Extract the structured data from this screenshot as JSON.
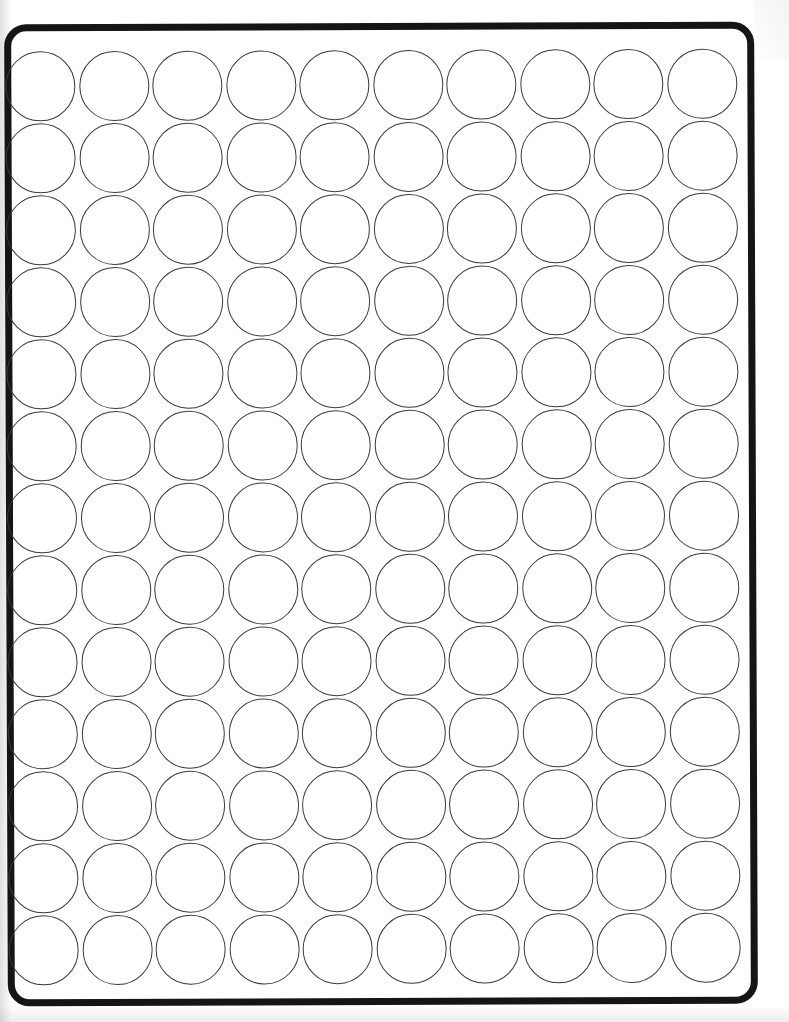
{
  "document": {
    "kind": "scanned-label-sheet",
    "title": "Blank circular label sheet",
    "description": "Scanned white sheet of blank round die-cut labels inside a thick rounded rectangular border.",
    "visible_text": [],
    "background_color": "#ffffff"
  },
  "frame": {
    "name": "label-sheet-border",
    "border_color": "#151515",
    "border_width_px": 7,
    "corner_radius_px": 22,
    "left_px": 6,
    "top_px": 23,
    "width_px": 750,
    "height_px": 982,
    "skew_deg": -0.22
  },
  "grid": {
    "columns": 10,
    "rows": 13,
    "total_circles": 130,
    "circle_diameter_px": 70,
    "circle_stroke_color": "#3a3a3a",
    "circle_stroke_width_px": 1.6,
    "circle_fill": "none",
    "column_pitch_px": 73.5,
    "row_pitch_px": 72,
    "origin_left_px": 7,
    "origin_top_px": 50
  },
  "scan_artifacts": {
    "left_edge_shadow": true,
    "bottom_edge_shadow": true,
    "top_right_shadow": true,
    "paper_vignette": true
  }
}
